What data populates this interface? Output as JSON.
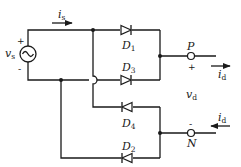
{
  "diagram": {
    "type": "single-phase full-bridge diode rectifier",
    "source": {
      "label": "v",
      "sub": "s",
      "plus": "+",
      "minus": "-"
    },
    "source_current": {
      "label": "i",
      "sub": "s"
    },
    "diodes": [
      {
        "label": "D",
        "sub": "1"
      },
      {
        "label": "D",
        "sub": "3"
      },
      {
        "label": "D",
        "sub": "4"
      },
      {
        "label": "D",
        "sub": "2"
      }
    ],
    "terminals": {
      "positive": {
        "label": "P",
        "sign": "+"
      },
      "negative": {
        "label": "N",
        "sign": "-"
      }
    },
    "output_voltage": {
      "label": "v",
      "sub": "d"
    },
    "output_current_top": {
      "label": "i",
      "sub": "d"
    },
    "output_current_bottom": {
      "label": "i",
      "sub": "d"
    }
  }
}
